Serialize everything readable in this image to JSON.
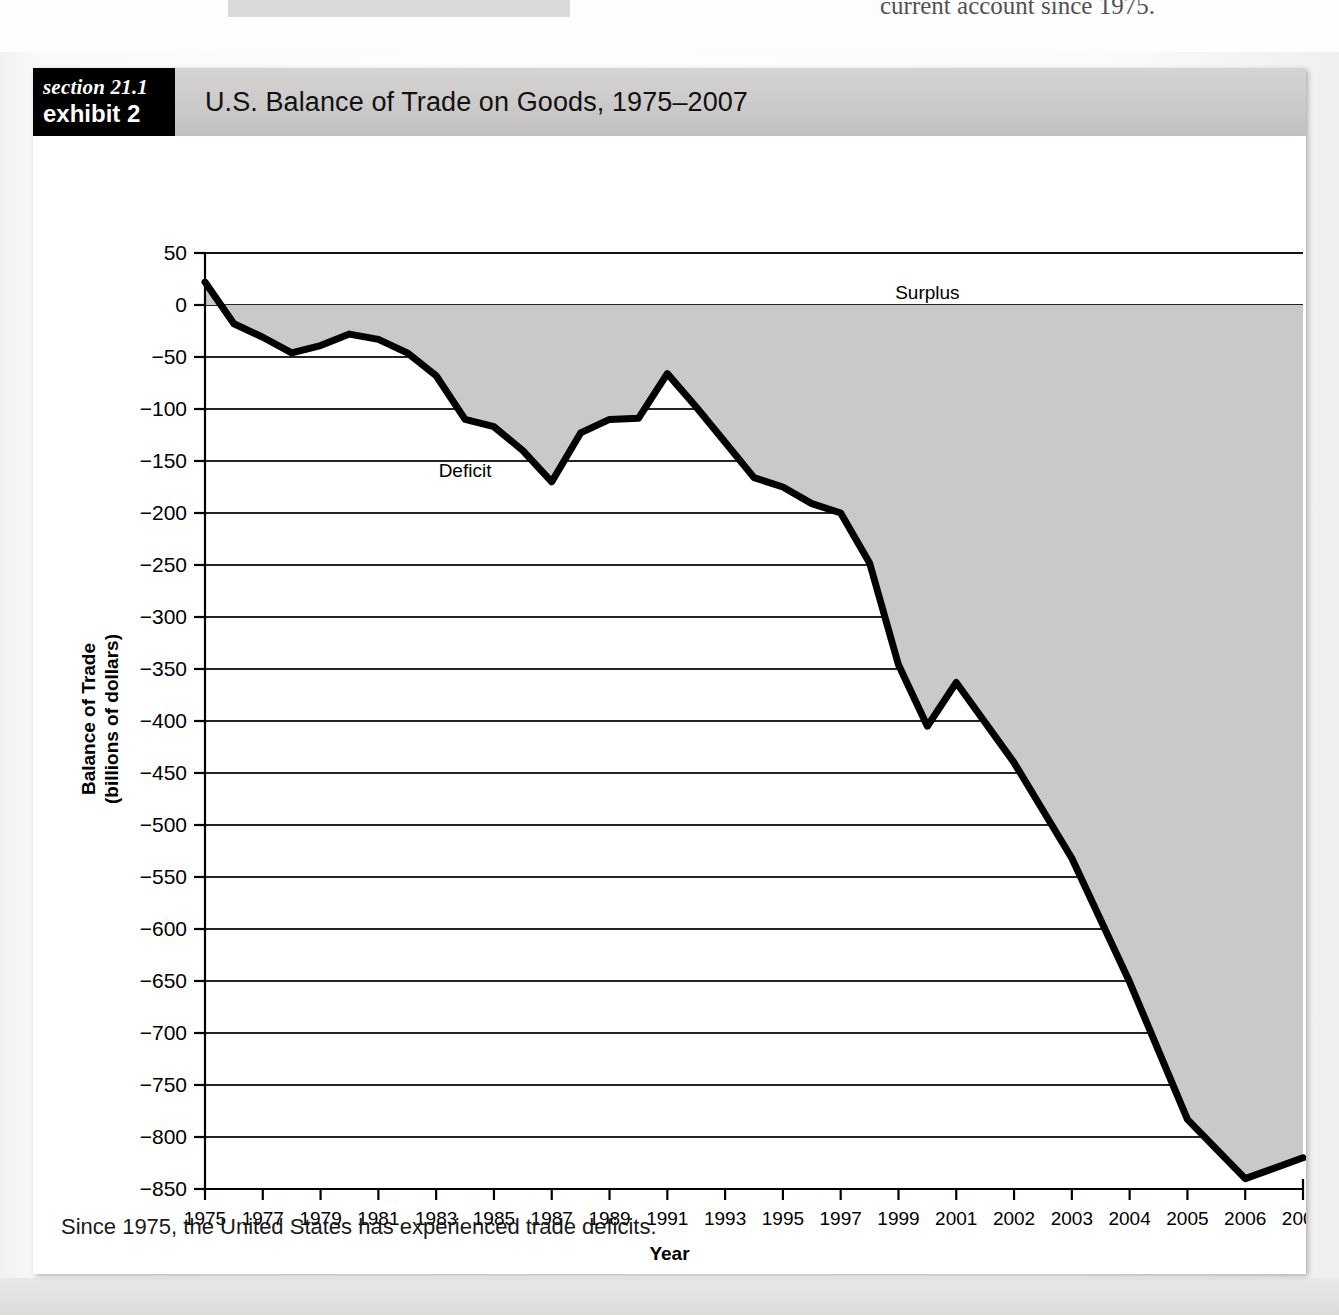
{
  "page": {
    "bleed_text_right": "current account since 1975."
  },
  "exhibit": {
    "tag_section": "section 21.1",
    "tag_exhibit": "exhibit 2",
    "title": "U.S. Balance of Trade on Goods, 1975–2007",
    "footer": "Since 1975, the United States has experienced trade deficits."
  },
  "chart_data": {
    "type": "line",
    "title": "U.S. Balance of Trade on Goods, 1975–2007",
    "xlabel": "Year",
    "ylabel": "Balance of Trade (billions of dollars)",
    "ylim": [
      -850,
      50
    ],
    "yticks": [
      50,
      0,
      -50,
      -100,
      -150,
      -200,
      -250,
      -300,
      -350,
      -400,
      -450,
      -500,
      -550,
      -600,
      -650,
      -700,
      -750,
      -800,
      -850
    ],
    "ytick_labels": [
      "50",
      "0",
      "−50",
      "−100",
      "−150",
      "−200",
      "−250",
      "−300",
      "−350",
      "−400",
      "−450",
      "−500",
      "−550",
      "−600",
      "−650",
      "−700",
      "−750",
      "−800",
      "−850"
    ],
    "xtick_labels": [
      "1975",
      "1977",
      "1979",
      "1981",
      "1983",
      "1985",
      "1987",
      "1989",
      "1991",
      "1993",
      "1995",
      "1997",
      "1999",
      "2001",
      "2002",
      "2003",
      "2004",
      "2005",
      "2006",
      "2007"
    ],
    "grid": true,
    "legend": "none",
    "annotations": [
      {
        "text": "Surplus",
        "x": 2000,
        "y": 12
      },
      {
        "text": "Deficit",
        "x": 1984,
        "y": -160
      }
    ],
    "series": [
      {
        "name": "Balance of Trade on Goods",
        "categories": [
          "1975",
          "1976",
          "1977",
          "1978",
          "1979",
          "1980",
          "1981",
          "1982",
          "1983",
          "1984",
          "1985",
          "1986",
          "1987",
          "1988",
          "1989",
          "1990",
          "1991",
          "1992",
          "1993",
          "1994",
          "1995",
          "1996",
          "1997",
          "1998",
          "1999",
          "2000",
          "2001",
          "2002",
          "2003",
          "2004",
          "2005",
          "2006",
          "2007"
        ],
        "values": [
          22,
          -18,
          -31,
          -46,
          -39,
          -28,
          -33,
          -46,
          -68,
          -110,
          -117,
          -140,
          -170,
          -123,
          -110,
          -109,
          -66,
          -98,
          -132,
          -166,
          -175,
          -191,
          -200,
          -248,
          -346,
          -405,
          -363,
          -440,
          -532,
          -651,
          -783,
          -840,
          -820
        ]
      }
    ]
  }
}
